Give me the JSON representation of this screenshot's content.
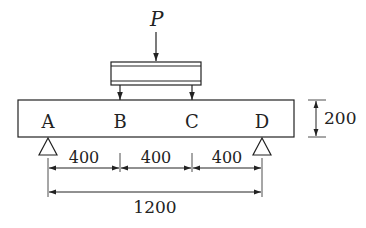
{
  "load": {
    "label": "P"
  },
  "points": [
    {
      "label": "A",
      "x": 48
    },
    {
      "label": "B",
      "x": 120
    },
    {
      "label": "C",
      "x": 192
    },
    {
      "label": "D",
      "x": 262
    }
  ],
  "dimensions": {
    "spans": [
      "400",
      "400",
      "400"
    ],
    "total": "1200",
    "height": "200"
  },
  "colors": {
    "line": "#222222",
    "background": "#ffffff"
  }
}
